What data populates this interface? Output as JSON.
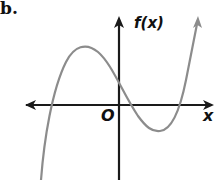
{
  "problem_label": "b.",
  "axes": {
    "y_label": "f(x)",
    "x_label": "x",
    "origin_label": "O",
    "axis_color": "#1a1a1a"
  },
  "curve": {
    "description": "cubic function graph with local maximum left of y-axis and local minimum right of y-axis",
    "color": "#8c8c8c",
    "features": {
      "local_max": "left of y-axis, above x-axis",
      "local_min": "right of y-axis, below x-axis",
      "y_intercept": "positive, just above origin",
      "x_intercepts": 3
    }
  }
}
